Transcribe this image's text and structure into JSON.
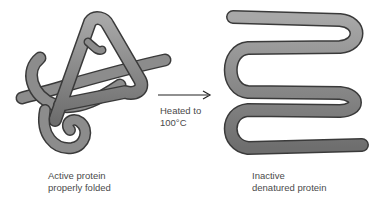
{
  "diagram": {
    "left": {
      "caption_line1": "Active protein",
      "caption_line2": "properly folded"
    },
    "arrow": {
      "label_line1": "Heated to",
      "label_line2": "100°C"
    },
    "right": {
      "caption_line1": "Inactive",
      "caption_line2": "denatured protein"
    },
    "colors": {
      "tube": "#8c8c8c",
      "tube_outline": "#3a3a3a",
      "text": "#4a4a4a",
      "arrow": "#222222"
    }
  }
}
